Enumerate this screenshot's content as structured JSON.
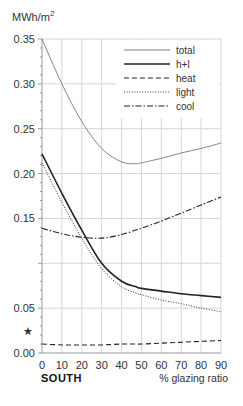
{
  "chart_data": {
    "type": "line",
    "title": "",
    "unit_label": "MWh/m",
    "unit_superscript": "2",
    "xlabel": "% glazing ratio",
    "region_label": "SOUTH",
    "ylabel": "MWh/m2",
    "xlim": [
      0,
      90
    ],
    "ylim": [
      0,
      0.35
    ],
    "x_ticks": [
      0,
      10,
      20,
      30,
      40,
      50,
      60,
      70,
      80,
      90
    ],
    "x_tick_labels": [
      "0",
      "10",
      "20",
      "30",
      "40",
      "50",
      "60",
      "70",
      "80",
      "90"
    ],
    "y_ticks": [
      0.0,
      0.05,
      0.15,
      0.2,
      0.25,
      0.3,
      0.35
    ],
    "y_tick_labels": [
      "0.00",
      "0.05",
      "0.15",
      "0.20",
      "0.25",
      "0.30",
      "0.35"
    ],
    "y_marker": {
      "value": 0.025,
      "symbol": "★"
    },
    "grid": true,
    "legend_position": "top-right",
    "x": [
      0,
      10,
      20,
      30,
      40,
      47,
      50,
      60,
      70,
      80,
      90
    ],
    "series": [
      {
        "name": "total",
        "style": "thin-solid",
        "values": [
          0.35,
          0.3,
          0.258,
          0.228,
          0.213,
          0.211,
          0.212,
          0.217,
          0.223,
          0.228,
          0.234
        ]
      },
      {
        "name": "h+l",
        "style": "thick-solid",
        "values": [
          0.222,
          0.178,
          0.137,
          0.1,
          0.08,
          0.074,
          0.072,
          0.069,
          0.066,
          0.064,
          0.062
        ]
      },
      {
        "name": "heat",
        "style": "dashed",
        "values": [
          0.01,
          0.009,
          0.009,
          0.009,
          0.01,
          0.01,
          0.01,
          0.011,
          0.012,
          0.013,
          0.014
        ]
      },
      {
        "name": "light",
        "style": "dotted",
        "values": [
          0.212,
          0.168,
          0.128,
          0.094,
          0.074,
          0.067,
          0.065,
          0.059,
          0.055,
          0.05,
          0.046
        ]
      },
      {
        "name": "cool",
        "style": "dash-dot",
        "values": [
          0.139,
          0.133,
          0.129,
          0.128,
          0.132,
          0.137,
          0.139,
          0.147,
          0.156,
          0.165,
          0.174
        ]
      }
    ]
  }
}
